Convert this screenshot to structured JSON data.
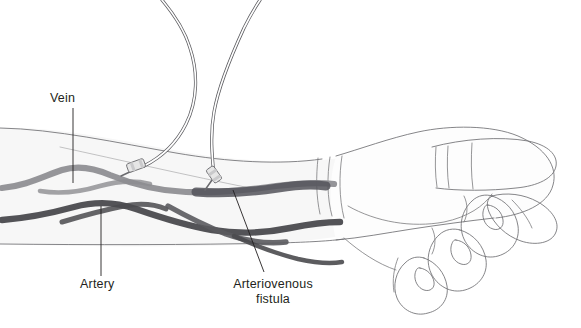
{
  "figure": {
    "background_color": "#ffffff",
    "width": 581,
    "height": 328
  },
  "labels": [
    {
      "id": "vein",
      "text": "Vein",
      "text_x": 50,
      "text_y": 102,
      "anchor": "start",
      "leader": "M 73,108 L 73,183"
    },
    {
      "id": "artery",
      "text": "Artery",
      "text_x": 80,
      "text_y": 288,
      "anchor": "start",
      "leader": "M 101,276 L 101,206"
    },
    {
      "id": "arteriovenous-fistula",
      "line1": "Arteriovenous",
      "line2": "fistula",
      "text_x": 273,
      "text_y": 288,
      "anchor": "middle",
      "leader": "M 264,272 L 233,190"
    }
  ],
  "anatomy": {
    "vein_label": "Vein",
    "artery_label": "Artery",
    "fistula_label": "Arteriovenous fistula",
    "vein_color": "#8c8c90",
    "artery_color": "#4a4a4e",
    "fistula_color": "#5a5a5e",
    "skin_fill": "#f7f7f7",
    "outline_color": "#6f6f72"
  },
  "equipment": {
    "tube_count": 2,
    "tube_label": "dialysis tubing",
    "needle_label": "cannula needle",
    "connector_label": "needle hub connector",
    "tube_color": "#5c5c60"
  }
}
